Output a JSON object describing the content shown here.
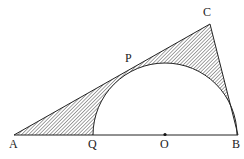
{
  "diagram": {
    "title": "",
    "points": {
      "A": {
        "label": "A"
      },
      "B": {
        "label": "B"
      },
      "C": {
        "label": "C"
      },
      "O": {
        "label": "O"
      },
      "P": {
        "label": "P"
      },
      "Q": {
        "label": "Q"
      }
    },
    "colors": {
      "line": "#222222",
      "hatch": "#333333",
      "background": "#ffffff"
    }
  }
}
